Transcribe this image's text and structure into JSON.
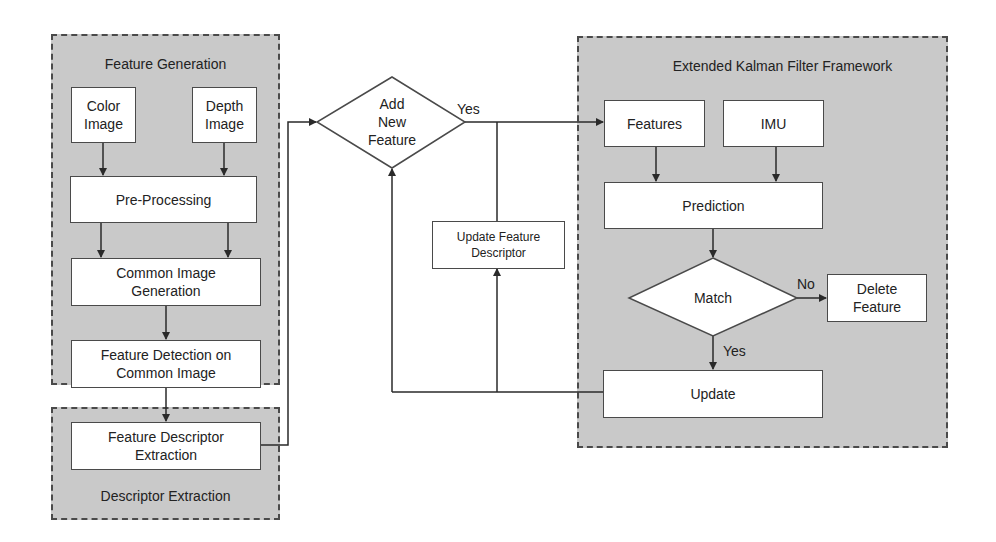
{
  "groups": {
    "feature_generation": {
      "title": "Feature Generation"
    },
    "descriptor_extraction": {
      "title": "Descriptor Extraction"
    },
    "ekf_framework": {
      "title": "Extended Kalman Filter Framework"
    }
  },
  "nodes": {
    "color_image": "Color\nImage",
    "depth_image": "Depth\nImage",
    "pre_processing": "Pre-Processing",
    "common_image_generation": "Common Image\nGeneration",
    "feature_detection": "Feature Detection on\nCommon Image",
    "feature_descriptor_extraction": "Feature Descriptor\nExtraction",
    "add_new_feature": "Add\nNew\nFeature",
    "update_feature_descriptor": "Update Feature\nDescriptor",
    "features": "Features",
    "imu": "IMU",
    "prediction": "Prediction",
    "match": "Match",
    "delete_feature": "Delete\nFeature",
    "update": "Update"
  },
  "edge_labels": {
    "add_new_feature_yes": "Yes",
    "match_no": "No",
    "match_yes": "Yes"
  },
  "colors": {
    "group_fill": "#c9c9c9",
    "box_fill": "#ffffff",
    "stroke": "#4a4a4a",
    "line": "#2a2a2a"
  }
}
